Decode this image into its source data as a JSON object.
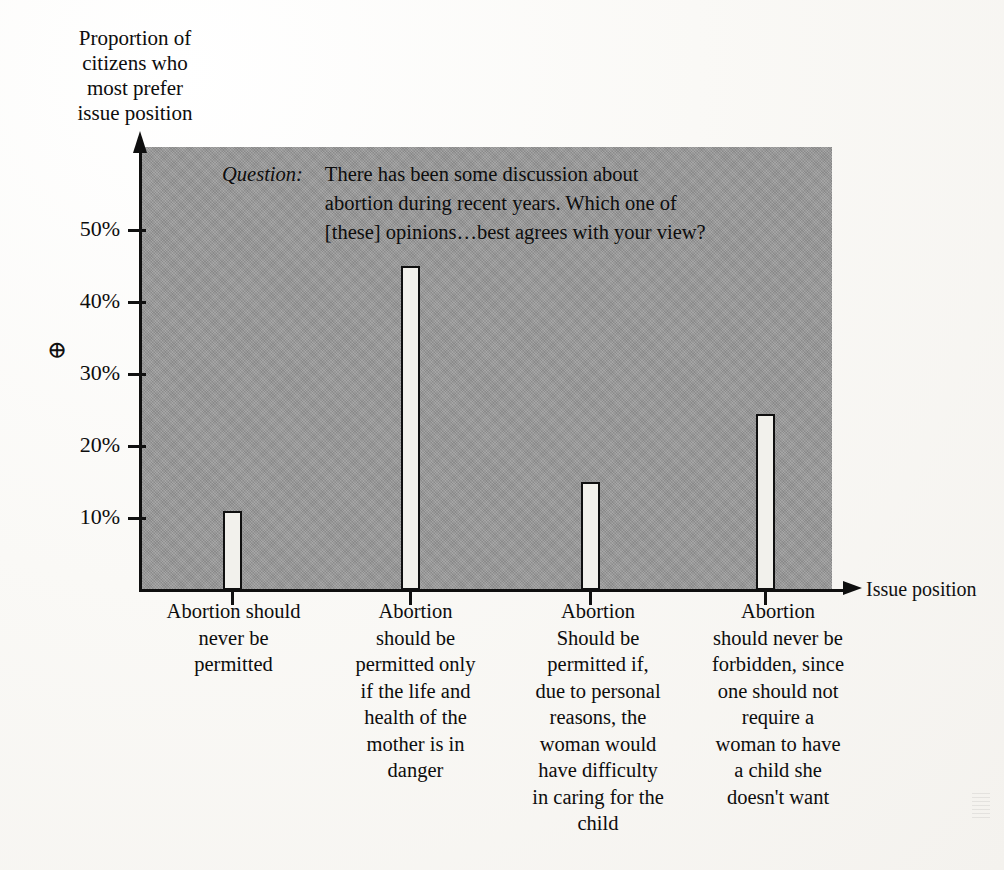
{
  "chart_data": {
    "type": "bar",
    "title": "",
    "xlabel": "Issue position",
    "ylabel": "Proportion of\ncitizens who\nmost prefer\nissue position",
    "ylim": [
      0,
      57
    ],
    "grid": false,
    "legend": "none",
    "ytick_labels": [
      "50%",
      "40%",
      "30%",
      "20%",
      "10%"
    ],
    "ytick_values": [
      50,
      40,
      30,
      20,
      10
    ],
    "categories": [
      "Abortion should\nnever be\npermitted",
      "Abortion\nshould be\npermitted only\nif the life and\nhealth of the\nmother is in\ndanger",
      "Abortion\nShould be\npermitted if,\ndue to personal\nreasons, the\nwoman would\nhave difficulty\nin caring for the\nchild",
      "Abortion\nshould never be\nforbidden, since\none should not\nrequire a\nwoman to have\na child she\ndoesn't want"
    ],
    "values": [
      11,
      45,
      15,
      24.5
    ],
    "annotations": {
      "question_label": "Question:",
      "question_text": "There has been some discussion about\nabortion during recent years. Which one of\n[these] opinions…best agrees with your view?",
      "marker_symbol": "⊕"
    },
    "colors": {
      "plot_background": "#979797",
      "bar_fill": "#f2f1ec",
      "bar_outline": "#101010",
      "page_background": "#faf9f6",
      "text": "#0d0d0d"
    }
  },
  "axis": {
    "y_title": "Proportion of\ncitizens who\nmost prefer\nissue position",
    "x_title": "Issue position",
    "ticks": [
      {
        "label": "50%"
      },
      {
        "label": "40%"
      },
      {
        "label": "30%"
      },
      {
        "label": "20%"
      },
      {
        "label": "10%"
      }
    ]
  },
  "question": {
    "label": "Question:",
    "text": "There has been some discussion about\nabortion during recent years. Which one of\n[these] opinions…best agrees with your view?"
  },
  "marker": {
    "symbol": "⊕"
  },
  "categories": [
    {
      "label": "Abortion should\nnever be\npermitted"
    },
    {
      "label": "Abortion\nshould be\npermitted only\nif the life and\nhealth of the\nmother is in\ndanger"
    },
    {
      "label": "Abortion\nShould be\npermitted if,\ndue to personal\nreasons, the\nwoman would\nhave difficulty\nin caring for the\nchild"
    },
    {
      "label": "Abortion\nshould never be\nforbidden, since\none should not\nrequire a\nwoman to have\na child she\ndoesn't want"
    }
  ]
}
